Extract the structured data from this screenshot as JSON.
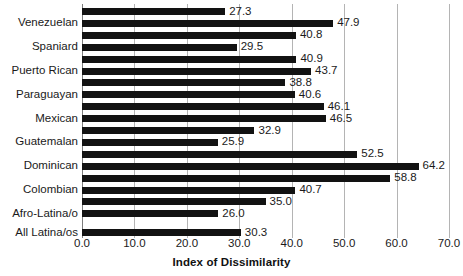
{
  "chart_data": {
    "type": "bar",
    "orientation": "horizontal",
    "title": "",
    "xlabel": "Index of Dissimilarity",
    "ylabel": "",
    "xlim": [
      0.0,
      70.0
    ],
    "xticks": [
      "0.0",
      "10.0",
      "20.0",
      "30.0",
      "40.0",
      "50.0",
      "60.0",
      "70.0"
    ],
    "xtick_values": [
      0,
      10,
      20,
      30,
      40,
      50,
      60,
      70
    ],
    "grid": true,
    "legend": false,
    "bar_color": "#121212",
    "grid_color": "#b4b4b4",
    "categories": [
      "Venezuelan",
      "Spaniard",
      "Puerto Rican",
      "Paraguayan",
      "Mexican",
      "Guatemalan",
      "Dominican",
      "Colombian",
      "Afro-Latina/o",
      "All Latina/os"
    ],
    "bars": [
      {
        "value": 27.3,
        "label": "27.3",
        "category": "Venezuelan",
        "pair_index": 0
      },
      {
        "value": 47.9,
        "label": "47.9",
        "category": "Venezuelan",
        "pair_index": 1
      },
      {
        "value": 40.8,
        "label": "40.8",
        "category": "Spaniard",
        "pair_index": 0
      },
      {
        "value": 29.5,
        "label": "29.5",
        "category": "Spaniard",
        "pair_index": 1
      },
      {
        "value": 40.9,
        "label": "40.9",
        "category": "Puerto Rican",
        "pair_index": 0
      },
      {
        "value": 43.7,
        "label": "43.7",
        "category": "Puerto Rican",
        "pair_index": 1
      },
      {
        "value": 38.8,
        "label": "38.8",
        "category": "Paraguayan",
        "pair_index": 0
      },
      {
        "value": 40.6,
        "label": "40.6",
        "category": "Paraguayan",
        "pair_index": 1
      },
      {
        "value": 46.1,
        "label": "46.1",
        "category": "Mexican",
        "pair_index": 0
      },
      {
        "value": 46.5,
        "label": "46.5",
        "category": "Mexican",
        "pair_index": 1
      },
      {
        "value": 32.9,
        "label": "32.9",
        "category": "Guatemalan",
        "pair_index": 0
      },
      {
        "value": 25.9,
        "label": "25.9",
        "category": "Guatemalan",
        "pair_index": 1
      },
      {
        "value": 52.5,
        "label": "52.5",
        "category": "Dominican",
        "pair_index": 0
      },
      {
        "value": 64.2,
        "label": "64.2",
        "category": "Dominican",
        "pair_index": 1
      },
      {
        "value": 58.8,
        "label": "58.8",
        "category": "Colombian",
        "pair_index": 0
      },
      {
        "value": 40.7,
        "label": "40.7",
        "category": "Colombian",
        "pair_index": 1
      },
      {
        "value": 35.0,
        "label": "35.0",
        "category": "Afro-Latina/o",
        "pair_index": 0
      },
      {
        "value": 26.0,
        "label": "26.0",
        "category": "Afro-Latina/o",
        "pair_index": 1
      },
      {
        "value": 30.3,
        "label": "30.3",
        "category": "All Latina/os",
        "pair_index": 0
      }
    ]
  }
}
